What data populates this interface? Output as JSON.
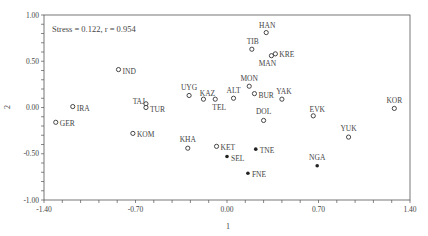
{
  "chart_data": {
    "type": "scatter",
    "title": "",
    "annotation": "Stress = 0.122, r = 0.954",
    "xlabel": "1",
    "ylabel": "2",
    "xlim": [
      -1.4,
      1.4
    ],
    "ylim": [
      -1.0,
      1.0
    ],
    "x_ticks": [
      "-1.40",
      "-0.70",
      "0.00",
      "0.70",
      "1.40"
    ],
    "y_ticks": [
      "1.00",
      "0.50",
      "0.00",
      "-0.50",
      "-1.00"
    ],
    "grid": false,
    "legend": null,
    "series": [
      {
        "name": "open-markers",
        "marker": "open-circle",
        "points": [
          {
            "label": "IRA",
            "x": -1.18,
            "y": 0.01
          },
          {
            "label": "GER",
            "x": -1.31,
            "y": -0.16
          },
          {
            "label": "IND",
            "x": -0.83,
            "y": 0.41
          },
          {
            "label": "TAJ",
            "x": -0.62,
            "y": 0.04
          },
          {
            "label": "TUR",
            "x": -0.62,
            "y": 0.0
          },
          {
            "label": "KOM",
            "x": -0.72,
            "y": -0.28
          },
          {
            "label": "UYG",
            "x": -0.29,
            "y": 0.13
          },
          {
            "label": "KAZ",
            "x": -0.18,
            "y": 0.09
          },
          {
            "label": "TEL",
            "x": -0.09,
            "y": 0.09
          },
          {
            "label": "ALT",
            "x": 0.05,
            "y": 0.1
          },
          {
            "label": "KHA",
            "x": -0.3,
            "y": -0.44
          },
          {
            "label": "KET",
            "x": -0.08,
            "y": -0.42
          },
          {
            "label": "MON",
            "x": 0.17,
            "y": 0.23
          },
          {
            "label": "BUR",
            "x": 0.21,
            "y": 0.15
          },
          {
            "label": "YAK",
            "x": 0.42,
            "y": 0.09
          },
          {
            "label": "DOL",
            "x": 0.28,
            "y": -0.14
          },
          {
            "label": "EVK",
            "x": 0.66,
            "y": -0.09
          },
          {
            "label": "YUK",
            "x": 0.93,
            "y": -0.32
          },
          {
            "label": "KOR",
            "x": 1.28,
            "y": -0.01
          },
          {
            "label": "HAN",
            "x": 0.3,
            "y": 0.81
          },
          {
            "label": "TIB",
            "x": 0.19,
            "y": 0.63
          },
          {
            "label": "MAN",
            "x": 0.34,
            "y": 0.56
          },
          {
            "label": "KRE",
            "x": 0.37,
            "y": 0.58
          }
        ]
      },
      {
        "name": "filled-markers",
        "marker": "filled-circle",
        "points": [
          {
            "label": "SEL",
            "x": 0.0,
            "y": -0.53
          },
          {
            "label": "TNE",
            "x": 0.22,
            "y": -0.45
          },
          {
            "label": "FNE",
            "x": 0.16,
            "y": -0.71
          },
          {
            "label": "NGA",
            "x": 0.69,
            "y": -0.63
          }
        ]
      }
    ]
  },
  "label_offsets": {
    "IRA": [
      4,
      4,
      "start"
    ],
    "GER": [
      4,
      4,
      "start"
    ],
    "IND": [
      4,
      4,
      "start"
    ],
    "TAJ": [
      -1,
      0,
      "end"
    ],
    "TUR": [
      4,
      4,
      "start"
    ],
    "KOM": [
      4,
      4,
      "start"
    ],
    "UYG": [
      0,
      -5,
      "middle"
    ],
    "KAZ": [
      4,
      -3,
      "middle"
    ],
    "TEL": [
      4,
      11,
      "middle"
    ],
    "ALT": [
      0,
      -5,
      "middle"
    ],
    "KHA": [
      0,
      -6,
      "middle"
    ],
    "KET": [
      4,
      4,
      "start"
    ],
    "MON": [
      0,
      -5,
      "middle"
    ],
    "BUR": [
      4,
      4,
      "start"
    ],
    "YAK": [
      2,
      -5,
      "middle"
    ],
    "DOL": [
      0,
      -6,
      "middle"
    ],
    "EVK": [
      4,
      -4,
      "middle"
    ],
    "YUK": [
      0,
      -6,
      "middle"
    ],
    "KOR": [
      0,
      -5,
      "middle"
    ],
    "HAN": [
      1,
      -5,
      "middle"
    ],
    "TIB": [
      1,
      -5,
      "middle"
    ],
    "MAN": [
      -4,
      10,
      "middle"
    ],
    "KRE": [
      4,
      3,
      "start"
    ],
    "SEL": [
      4,
      4,
      "start"
    ],
    "TNE": [
      4,
      4,
      "start"
    ],
    "FNE": [
      4,
      4,
      "start"
    ],
    "NGA": [
      0,
      -6,
      "middle"
    ]
  }
}
